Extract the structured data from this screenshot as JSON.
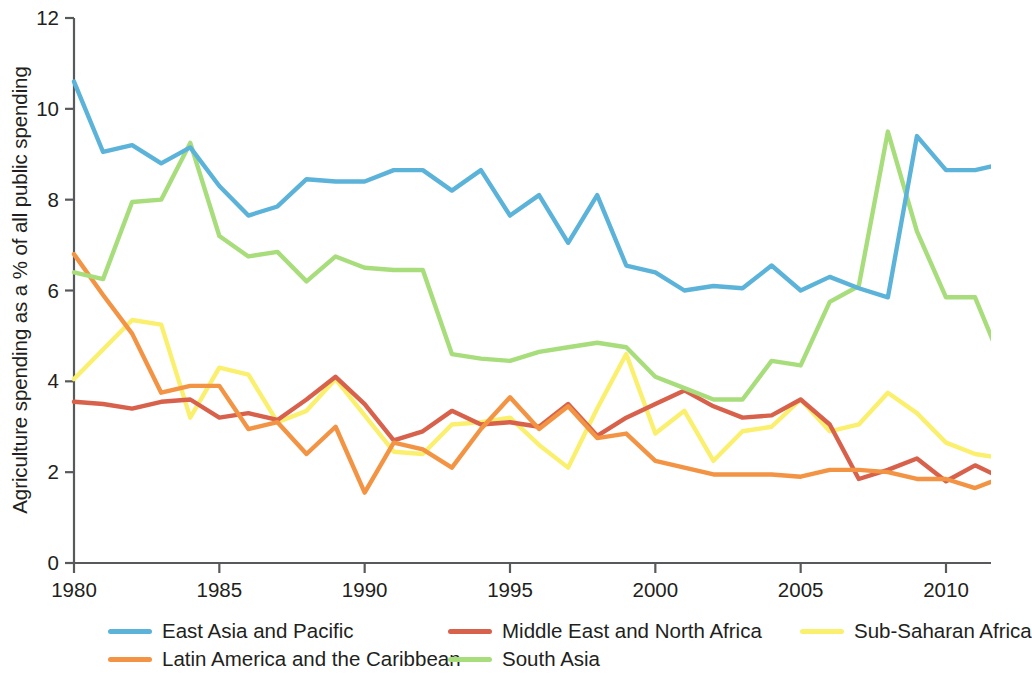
{
  "chart_data": {
    "type": "line",
    "title": "",
    "xlabel": "",
    "ylabel": "Agriculture spending as a % of all public spending",
    "xlim": [
      1980,
      2012
    ],
    "ylim": [
      0,
      12
    ],
    "ytick_labels": [
      "0",
      "2",
      "4",
      "6",
      "8",
      "10",
      "12"
    ],
    "ytick_values": [
      0,
      2,
      4,
      6,
      8,
      10,
      12
    ],
    "xtick_labels": [
      "1980",
      "1985",
      "1990",
      "1995",
      "2000",
      "2005",
      "2010"
    ],
    "xtick_values": [
      1980,
      1985,
      1990,
      1995,
      2000,
      2005,
      2010
    ],
    "grid": false,
    "legend_position": "bottom",
    "x": [
      1980,
      1981,
      1982,
      1983,
      1984,
      1985,
      1986,
      1987,
      1988,
      1989,
      1990,
      1991,
      1992,
      1993,
      1994,
      1995,
      1996,
      1997,
      1998,
      1999,
      2000,
      2001,
      2002,
      2003,
      2004,
      2005,
      2006,
      2007,
      2008,
      2009,
      2010,
      2011,
      2012
    ],
    "series": [
      {
        "name": "East Asia and Pacific",
        "color": "#5cb3d9",
        "values": [
          10.6,
          9.05,
          9.2,
          8.8,
          9.15,
          8.3,
          7.65,
          7.85,
          8.45,
          8.4,
          8.4,
          8.65,
          8.65,
          8.2,
          8.65,
          7.65,
          8.1,
          7.05,
          8.1,
          6.55,
          6.4,
          6.0,
          6.1,
          6.05,
          6.55,
          6.0,
          6.3,
          6.05,
          5.85,
          9.4,
          8.65,
          8.65,
          8.8
        ]
      },
      {
        "name": "Latin America and the Caribbean",
        "color": "#f29443",
        "values": [
          6.8,
          5.9,
          5.05,
          3.75,
          3.9,
          3.9,
          2.95,
          3.1,
          2.4,
          3.0,
          1.55,
          2.65,
          2.5,
          2.1,
          2.95,
          3.65,
          2.95,
          3.45,
          2.75,
          2.85,
          2.25,
          2.1,
          1.95,
          1.95,
          1.95,
          1.9,
          2.05,
          2.05,
          2.0,
          1.85,
          1.85,
          1.65,
          1.9
        ]
      },
      {
        "name": "Middle East and North Africa",
        "color": "#d8614c",
        "values": [
          3.55,
          3.5,
          3.4,
          3.55,
          3.6,
          3.2,
          3.3,
          3.15,
          3.6,
          4.1,
          3.5,
          2.7,
          2.9,
          3.35,
          3.05,
          3.1,
          3.0,
          3.5,
          2.8,
          3.2,
          3.5,
          3.8,
          3.45,
          3.2,
          3.25,
          3.6,
          3.05,
          1.85,
          2.05,
          2.3,
          1.8,
          2.15,
          1.85
        ]
      },
      {
        "name": "South Asia",
        "color": "#a8dd7c",
        "values": [
          6.4,
          6.25,
          7.95,
          8.0,
          9.25,
          7.2,
          6.75,
          6.85,
          6.2,
          6.75,
          6.5,
          6.45,
          6.45,
          4.6,
          4.5,
          4.45,
          4.65,
          4.75,
          4.85,
          4.75,
          4.1,
          3.85,
          3.6,
          3.6,
          4.45,
          4.35,
          5.75,
          6.1,
          9.5,
          7.3,
          5.85,
          5.85,
          4.3
        ]
      },
      {
        "name": "Sub-Saharan Africa",
        "color": "#faf06e",
        "values": [
          4.05,
          4.7,
          5.35,
          5.25,
          3.2,
          4.3,
          4.15,
          3.1,
          3.35,
          4.05,
          3.25,
          2.45,
          2.4,
          3.05,
          3.1,
          3.2,
          2.6,
          2.1,
          3.4,
          4.6,
          2.85,
          3.35,
          2.25,
          2.9,
          3.0,
          3.6,
          2.9,
          3.05,
          3.75,
          3.3,
          2.65,
          2.4,
          2.3
        ]
      }
    ]
  },
  "legend": {
    "rows": [
      [
        {
          "label": "East Asia and Pacific",
          "color": "#5cb3d9",
          "x": 0
        },
        {
          "label": "Middle East and North Africa",
          "color": "#d8614c",
          "x": 340
        },
        {
          "label": "Sub-Saharan Africa",
          "color": "#faf06e",
          "x": 692
        }
      ],
      [
        {
          "label": "Latin America and the Caribbean",
          "color": "#f29443",
          "x": 0
        },
        {
          "label": "South Asia",
          "color": "#a8dd7c",
          "x": 340
        }
      ]
    ]
  },
  "axes": {
    "axis_color": "#58595b",
    "line_width": 4.4
  }
}
